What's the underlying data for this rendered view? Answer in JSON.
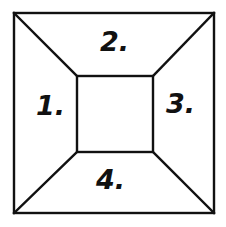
{
  "diagram": {
    "type": "square-frame-partition",
    "line_color": "#111111",
    "background_color": "#ffffff",
    "regions": [
      {
        "id": "left",
        "label": "1."
      },
      {
        "id": "top",
        "label": "2."
      },
      {
        "id": "right",
        "label": "3."
      },
      {
        "id": "bottom",
        "label": "4."
      }
    ],
    "center": {
      "id": "inner-square",
      "label": ""
    }
  }
}
